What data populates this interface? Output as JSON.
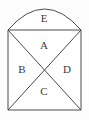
{
  "figure": {
    "background_color": "#fdfdfd",
    "stroke_color": "#4a4a4a",
    "face_color": "#ffffff",
    "label_color": "#3a3a3a",
    "geometry": {
      "square": {
        "left": 8,
        "top": 30,
        "right": 81,
        "bottom": 110,
        "width": 73,
        "height": 80
      },
      "arch": {
        "base_y": 30,
        "apex_y": 6,
        "left_x": 8,
        "right_x": 81,
        "rise": 24
      },
      "diagonal_intersection": {
        "x": 45,
        "y": 70
      }
    },
    "regions": [
      {
        "id": "region-e",
        "label": "E",
        "shape": "arch-segment",
        "position": "top",
        "label_x": 44,
        "label_y": 19
      },
      {
        "id": "region-a",
        "label": "A",
        "shape": "triangle",
        "position": "top",
        "label_x": 44,
        "label_y": 46
      },
      {
        "id": "region-b",
        "label": "B",
        "shape": "triangle",
        "position": "left",
        "label_x": 22,
        "label_y": 70
      },
      {
        "id": "region-c",
        "label": "C",
        "shape": "triangle",
        "position": "bottom",
        "label_x": 44,
        "label_y": 92
      },
      {
        "id": "region-d",
        "label": "D",
        "shape": "triangle",
        "position": "right",
        "label_x": 67,
        "label_y": 70
      }
    ]
  }
}
